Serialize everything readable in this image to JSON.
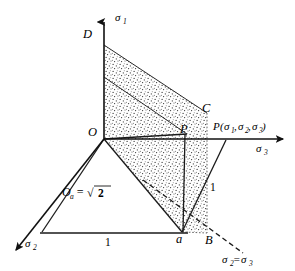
{
  "figure": {
    "background_color": "#ffffff",
    "line_color": "#1a1a1a",
    "stipple_color": "#3a3a3a"
  },
  "axes": [
    {
      "id": "sigma1",
      "label": "σ",
      "sub": "1",
      "description": "vertical axis upward"
    },
    {
      "id": "sigma3",
      "label": "σ",
      "sub": "3",
      "description": "horizontal axis to the right"
    },
    {
      "id": "sigma2",
      "label": "σ",
      "sub": "2",
      "description": "oblique axis to lower left"
    }
  ],
  "points": [
    {
      "id": "O",
      "label": "O",
      "x": 104,
      "y": 139
    },
    {
      "id": "D",
      "label": "D",
      "x": 89,
      "y": 34
    },
    {
      "id": "C",
      "label": "C",
      "x": 207,
      "y": 113
    },
    {
      "id": "P",
      "label": "P",
      "x": 187,
      "y": 134
    },
    {
      "id": "a",
      "label": "a",
      "x": 180,
      "y": 236
    },
    {
      "id": "B",
      "label": "B",
      "x": 210,
      "y": 235
    }
  ],
  "annotations": {
    "point_p_coords": {
      "name": "P",
      "open": "(",
      "s1": "σ",
      "s1sub": "1",
      "c1": ",",
      "s2": "σ",
      "s2sub": "2",
      "c2": ",",
      "s3": "σ",
      "s3sub": "3",
      "close": ")"
    },
    "oa_expression": {
      "lead": "O",
      "leadsub": "a",
      "eq": "=",
      "radical": "√",
      "value": "2"
    },
    "unit_bottom": "1",
    "unit_diagonal": "1",
    "sigma_equality": {
      "s2": "σ",
      "s2sub": "2",
      "eq": "=",
      "s3": "σ",
      "s3sub": "3"
    }
  },
  "labels": {
    "sigma1": "σ",
    "sigma1_sub": "1",
    "sigma2": "σ",
    "sigma2_sub": "2",
    "sigma3": "σ",
    "sigma3_sub": "3",
    "D": "D",
    "C": "C",
    "O": "O",
    "P": "P",
    "a": "a",
    "B": "B"
  }
}
